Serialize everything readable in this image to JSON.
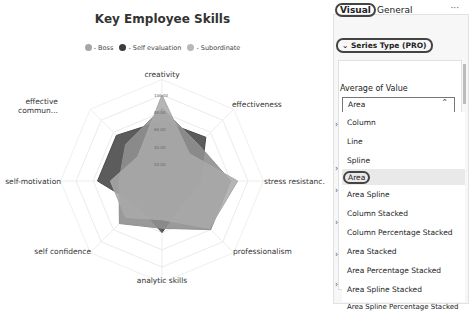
{
  "chart": {
    "title": "Key Employee Skills",
    "legend": [
      {
        "label": "- Boss",
        "color": "#a6a6a6"
      },
      {
        "label": "- Self evaluation",
        "color": "#3c3c3c"
      },
      {
        "label": "- Subordinate",
        "color": "#b8b8b8"
      }
    ],
    "axes": [
      "creativity",
      "effectiveness",
      "stress resistanc...",
      "professionalism",
      "analytic skills",
      "self confidence",
      "self-motivation",
      "effective commun..."
    ],
    "ticks": [
      "100.00",
      "80.00",
      "60.00",
      "40.00",
      "20.00"
    ]
  },
  "chart_data": {
    "type": "radar",
    "title": "Key Employee Skills",
    "categories": [
      "creativity",
      "effectiveness",
      "stress resistance",
      "professionalism",
      "analytic skills",
      "self confidence",
      "self-motivation",
      "effective communication"
    ],
    "series": [
      {
        "name": "Boss",
        "values": [
          85,
          60,
          80,
          80,
          55,
          70,
          50,
          60
        ]
      },
      {
        "name": "Self evaluation",
        "values": [
          70,
          72,
          45,
          35,
          60,
          40,
          75,
          75
        ]
      },
      {
        "name": "Subordinate",
        "values": [
          100,
          45,
          88,
          78,
          45,
          60,
          60,
          40
        ]
      }
    ],
    "rlim": [
      0,
      100
    ],
    "grid": true,
    "legend_position": "top"
  },
  "panel": {
    "tabs": [
      {
        "label": "Visual",
        "active": true
      },
      {
        "label": "General",
        "active": false
      }
    ],
    "more_label": "···",
    "section_title": "Series Type (PRO)",
    "section_chevron": "✓",
    "field_label": "Average of Value",
    "select_value": "Area",
    "select_chevron": "^",
    "options": [
      "Column",
      "Line",
      "Spline",
      "Area",
      "Area Spline",
      "Column Stacked",
      "Column Percentage Stacked",
      "Area Stacked",
      "Area Percentage Stacked",
      "Area Spline Stacked",
      "Area Spline Percentage Stacked"
    ],
    "selected_option": "Area"
  }
}
